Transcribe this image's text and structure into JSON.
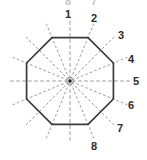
{
  "figure": {
    "title": "",
    "shape_name": "octagon",
    "center_marker": "center-dot",
    "labels": [
      {
        "text": "1",
        "x": 68,
        "y": 14
      },
      {
        "text": "2",
        "x": 94,
        "y": 18
      },
      {
        "text": "3",
        "x": 121,
        "y": 35
      },
      {
        "text": "4",
        "x": 131,
        "y": 59
      },
      {
        "text": "5",
        "x": 136,
        "y": 81
      },
      {
        "text": "6",
        "x": 131,
        "y": 105
      },
      {
        "text": "7",
        "x": 120,
        "y": 128
      },
      {
        "text": "8",
        "x": 94,
        "y": 146
      }
    ],
    "clipped_top_labels": [
      {
        "text": "8",
        "x": 68,
        "y": 1
      },
      {
        "text": "7",
        "x": 94,
        "y": 1
      }
    ],
    "geometry": {
      "center_x": 70,
      "center_y": 81,
      "octagon_radius": 47,
      "octagon_rotation_deg": 22.5,
      "spoke_count": 16,
      "spoke_length": 62,
      "hub_outer_radius": 3.4,
      "hub_inner_radius": 1.7
    },
    "colors": {
      "outline": "#3a3a3a",
      "spoke": "#8e8e8e",
      "label": "#2b2b2b",
      "hub_fill": "#e2e2e2",
      "hub_core": "#1c1c1c",
      "background": "#ffffff"
    }
  },
  "chart_data": {
    "type": "diagram",
    "categories": [
      "1",
      "2",
      "3",
      "4",
      "5",
      "6",
      "7",
      "8"
    ],
    "values": [
      1,
      2,
      3,
      4,
      5,
      6,
      7,
      8
    ],
    "annotations": [
      "Regular octagon outline drawn with solid dark stroke",
      "Sixteen dashed spokes radiate from a small central hub at 22.5 degree intervals",
      "Eight numbered callout labels 1 through 8 placed clockwise starting at top"
    ],
    "xlabel": "",
    "ylabel": "",
    "legend_position": "none",
    "grid": false
  }
}
